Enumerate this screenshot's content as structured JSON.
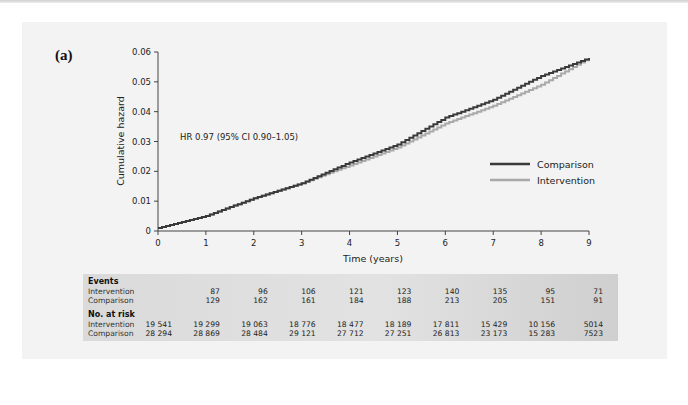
{
  "figure": {
    "panel_label": "(a)",
    "hr_annotation": "HR 0.97 (95% CI 0.90–1.05)"
  },
  "chart_data": {
    "type": "line",
    "title": "",
    "xlabel": "Time (years)",
    "ylabel": "Cumulative hazard",
    "xlim": [
      0,
      9
    ],
    "ylim": [
      0,
      0.06
    ],
    "x_ticks": [
      "0",
      "1",
      "2",
      "3",
      "4",
      "5",
      "6",
      "7",
      "8",
      "9"
    ],
    "y_ticks": [
      "0",
      "0.01",
      "0.02",
      "0.03",
      "0.04",
      "0.05",
      "0.06"
    ],
    "grid": false,
    "legend_position": "right, mid-height",
    "annotations": [
      "HR 0.97 (95% CI 0.90–1.05)"
    ],
    "x": [
      0,
      1,
      2,
      3,
      4,
      5,
      6,
      7,
      8,
      9
    ],
    "series": [
      {
        "name": "Comparison",
        "color": "#3a3a3a",
        "values": [
          0.001,
          0.005,
          0.011,
          0.016,
          0.023,
          0.029,
          0.038,
          0.044,
          0.052,
          0.058
        ]
      },
      {
        "name": "Intervention",
        "color": "#a9a9a9",
        "values": [
          0.001,
          0.005,
          0.011,
          0.016,
          0.022,
          0.028,
          0.036,
          0.042,
          0.049,
          0.058
        ]
      }
    ]
  },
  "legend": {
    "items": [
      {
        "label": "Comparison",
        "color": "#3a3a3a"
      },
      {
        "label": "Intervention",
        "color": "#a9a9a9"
      }
    ]
  },
  "risk_table": {
    "events_header": "Events",
    "at_risk_header": "No. at risk",
    "row_labels": {
      "intervention": "Intervention",
      "comparison": "Comparison"
    },
    "events": {
      "intervention": [
        "87",
        "96",
        "106",
        "121",
        "123",
        "140",
        "135",
        "95",
        "71"
      ],
      "comparison": [
        "129",
        "162",
        "161",
        "184",
        "188",
        "213",
        "205",
        "151",
        "91"
      ]
    },
    "at_risk": {
      "intervention": [
        "19 541",
        "19 299",
        "19 063",
        "18 776",
        "18 477",
        "18 189",
        "17 811",
        "15 429",
        "10 156",
        "5014"
      ],
      "comparison": [
        "28 294",
        "28 869",
        "28 484",
        "29 121",
        "27 712",
        "27 251",
        "26 813",
        "23 173",
        "15 283",
        "7523"
      ]
    }
  }
}
